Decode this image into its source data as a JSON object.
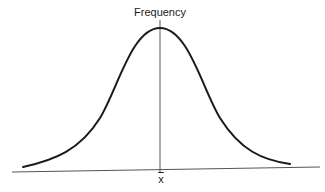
{
  "diagram": {
    "y_axis_label": "Frequency",
    "x_axis_mean_label": "x",
    "x_axis_mean_symbol": "x̄",
    "colors": {
      "curve": "#1a1a1a",
      "axis": "#555555",
      "background": "#ffffff"
    },
    "curve": {
      "type": "bell-curve",
      "peak": [
        160,
        28
      ],
      "left_end": [
        23,
        167
      ],
      "right_end": [
        290,
        164
      ]
    },
    "horizontal_axis": {
      "start": [
        12,
        172
      ],
      "end": [
        320,
        167
      ]
    },
    "vertical_axis": {
      "x": 160,
      "top": 20,
      "bottom": 173
    }
  }
}
